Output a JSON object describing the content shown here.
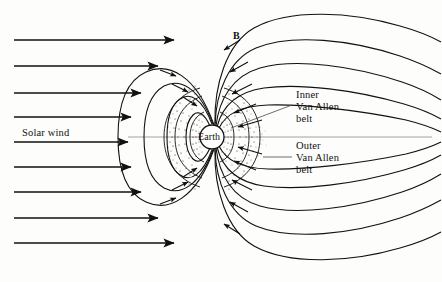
{
  "figure": {
    "background_color": "#fdfdfb",
    "line_color": "#111111",
    "stipple_color": "#2a2a2a"
  },
  "labels": {
    "solar_wind": "Solar wind",
    "field_symbol": "B",
    "earth": "Earth",
    "inner_belt_line1": "Inner",
    "inner_belt_line2": "Van Allen",
    "inner_belt_line3": "belt",
    "outer_belt_line1": "Outer",
    "outer_belt_line2": "Van Allen",
    "outer_belt_line3": "belt"
  },
  "diagram_data": {
    "type": "schematic",
    "axis_of_symmetry_y": 137,
    "earth": {
      "center_x": 212,
      "center_y": 137,
      "radius": 12,
      "fill": "#ffffff"
    },
    "solar_wind_arrows": [
      {
        "y": 40,
        "x_start": 14,
        "x_end": 176
      },
      {
        "y": 66,
        "x_start": 14,
        "x_end": 160
      },
      {
        "y": 93,
        "x_start": 14,
        "x_end": 143
      },
      {
        "y": 117,
        "x_start": 14,
        "x_end": 133
      },
      {
        "y": 142,
        "x_start": 14,
        "x_end": 130
      },
      {
        "y": 167,
        "x_start": 14,
        "x_end": 133
      },
      {
        "y": 192,
        "x_start": 14,
        "x_end": 143
      },
      {
        "y": 218,
        "x_start": 14,
        "x_end": 160
      },
      {
        "y": 243,
        "x_start": 14,
        "x_end": 176
      }
    ],
    "closed_field_lines_dayside": 4,
    "tail_field_lines_per_side": 5,
    "belts": {
      "inner": {
        "label": "Inner Van Allen belt",
        "shape": "crescent",
        "density": "dense"
      },
      "outer": {
        "label": "Outer Van Allen belt",
        "shape": "crescent",
        "density": "diffuse"
      }
    }
  }
}
